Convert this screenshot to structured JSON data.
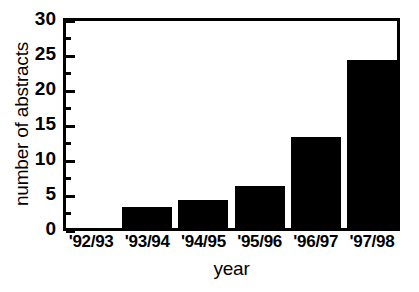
{
  "chart_data": {
    "type": "bar",
    "title": "",
    "subtitle": "",
    "xlabel": "year",
    "ylabel": "number of abstracts",
    "categories": [
      "'92/93",
      "'93/94",
      "'94/95",
      "'95/96",
      "'96/97",
      "'97/98"
    ],
    "values": [
      0,
      3,
      4,
      6,
      13,
      24
    ],
    "series": [
      {
        "name": "number of abstracts",
        "values": [
          0,
          3,
          4,
          6,
          13,
          24
        ]
      }
    ],
    "ylim": [
      0,
      30
    ],
    "ytick_labels": [
      "0",
      "5",
      "10",
      "15",
      "20",
      "25",
      "30"
    ],
    "ytick_values": [
      0,
      5,
      10,
      15,
      20,
      25,
      30
    ],
    "yminor_values": [
      2.5,
      7.5,
      12.5,
      17.5,
      22.5,
      27.5
    ],
    "grid": false,
    "legend": false,
    "legend_position": "none",
    "bar_color": "#000000",
    "axis_color": "#000000",
    "background_color": "#ffffff"
  }
}
